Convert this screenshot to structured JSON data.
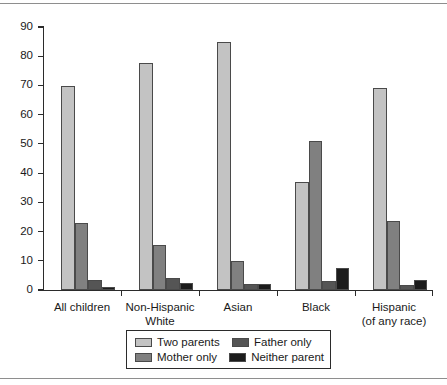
{
  "chart_data": {
    "type": "bar",
    "title": "",
    "subtitle": "",
    "xlabel": "",
    "ylabel": "",
    "ylim": [
      0,
      90
    ],
    "yticks": [
      0,
      10,
      20,
      30,
      40,
      50,
      60,
      70,
      80,
      90
    ],
    "ytick_labels": [
      "0",
      "10",
      "20",
      "30",
      "40",
      "50",
      "60",
      "70",
      "80",
      "90"
    ],
    "grid": false,
    "legend_position": "bottom-center",
    "categories": [
      "All children",
      "Non-Hispanic\nWhite",
      "Asian",
      "Black",
      "Hispanic\n(of any race)"
    ],
    "series": [
      {
        "name": "Two parents",
        "color": "#c3c3c3",
        "values": [
          69.8,
          77.8,
          84.8,
          37.0,
          69.2
        ]
      },
      {
        "name": "Mother only",
        "color": "#808080",
        "values": [
          22.9,
          15.4,
          10.1,
          51.0,
          23.5
        ]
      },
      {
        "name": "Father only",
        "color": "#555555",
        "values": [
          3.4,
          4.0,
          1.9,
          3.0,
          1.8
        ]
      },
      {
        "name": "Neither parent",
        "color": "#1c1c1c",
        "values": [
          0.9,
          2.3,
          2.2,
          7.5,
          3.3
        ]
      }
    ]
  },
  "legend": {
    "entries": [
      {
        "label": "Two parents",
        "color": "#c3c3c3"
      },
      {
        "label": "Father only",
        "color": "#555555"
      },
      {
        "label": "Mother only",
        "color": "#808080"
      },
      {
        "label": "Neither parent",
        "color": "#1c1c1c"
      }
    ]
  },
  "colors": {
    "two_parents": "#c3c3c3",
    "mother_only": "#808080",
    "father_only": "#555555",
    "neither_parent": "#1c1c1c",
    "axis": "#2b2b2b",
    "rule": "#8e8e8e",
    "background": "#ffffff"
  }
}
